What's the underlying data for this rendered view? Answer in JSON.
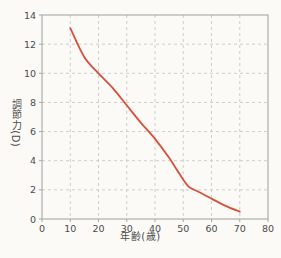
{
  "figure": {
    "background": "#fbfaf7"
  },
  "chart_data": {
    "type": "line",
    "title": "",
    "xlabel": "年齢(歳)",
    "ylabel": "調節力(D)",
    "x": [
      10,
      15,
      20,
      25,
      30,
      35,
      40,
      45,
      48,
      50,
      52,
      55,
      60,
      65,
      70
    ],
    "y": [
      13.1,
      11.1,
      10.0,
      9.0,
      7.8,
      6.6,
      5.5,
      4.2,
      3.3,
      2.7,
      2.2,
      1.9,
      1.4,
      0.9,
      0.5
    ],
    "xlim": [
      0,
      80
    ],
    "ylim": [
      0,
      14
    ],
    "xticks": [
      0,
      10,
      20,
      30,
      40,
      50,
      60,
      70,
      80
    ],
    "yticks": [
      0,
      2,
      4,
      6,
      8,
      10,
      12,
      14
    ],
    "grid": "dashed",
    "legend": "none",
    "colors": {
      "line": "#d6503c",
      "grid": "#c7c9c5",
      "border": "#a5a8a3",
      "text": "#4b4b4b",
      "background": "#fbfaf7"
    }
  }
}
